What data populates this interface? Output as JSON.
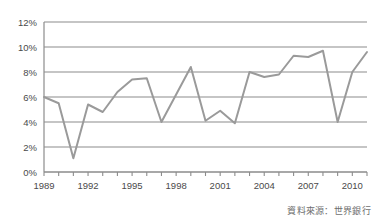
{
  "chart_data": {
    "type": "line",
    "title": "",
    "subtitle": "",
    "xlabel": "",
    "ylabel": "",
    "xlim": [
      1989,
      2011
    ],
    "ylim": [
      0,
      12
    ],
    "ytick_labels": [
      "0%",
      "2%",
      "4%",
      "6%",
      "8%",
      "10%",
      "12%"
    ],
    "ytick_values": [
      0,
      2,
      4,
      6,
      8,
      10,
      12
    ],
    "xtick_labels": [
      "1989",
      "1992",
      "1995",
      "1998",
      "2001",
      "2004",
      "2007",
      "2010"
    ],
    "xtick_values": [
      1989,
      1992,
      1995,
      1998,
      2001,
      2004,
      2007,
      2010
    ],
    "minor_xticks": [
      1989,
      1990,
      1991,
      1992,
      1993,
      1994,
      1995,
      1996,
      1997,
      1998,
      1999,
      2000,
      2001,
      2002,
      2003,
      2004,
      2005,
      2006,
      2007,
      2008,
      2009,
      2010,
      2011
    ],
    "grid": true,
    "grid_axis": "y",
    "legend": false,
    "legend_position": "none",
    "x": [
      1989,
      1990,
      1991,
      1992,
      1993,
      1994,
      1995,
      1996,
      1997,
      1998,
      1999,
      2000,
      2001,
      2002,
      2003,
      2004,
      2005,
      2006,
      2007,
      2008,
      2009,
      2010,
      2011
    ],
    "values": [
      6.0,
      5.5,
      1.1,
      5.4,
      4.8,
      6.4,
      7.4,
      7.5,
      4.0,
      6.2,
      8.4,
      4.1,
      4.9,
      3.9,
      8.0,
      7.6,
      7.8,
      9.3,
      9.2,
      9.7,
      4.0,
      8.0,
      9.6
    ],
    "series": [
      {
        "name": "",
        "color": "#9a9a9a",
        "values": [
          6.0,
          5.5,
          1.1,
          5.4,
          4.8,
          6.4,
          7.4,
          7.5,
          4.0,
          6.2,
          8.4,
          4.1,
          4.9,
          3.9,
          8.0,
          7.6,
          7.8,
          9.3,
          9.2,
          9.7,
          4.0,
          8.0,
          9.6
        ]
      }
    ],
    "annotations": []
  },
  "figure": {
    "source_note": "資料來源：世界銀行",
    "colors": {
      "line": "#9a9a9a",
      "grid": "#8c8c8c",
      "axis": "#8c8c8c",
      "tick_text": "#4a4a4a",
      "source_text": "#6e6e6e",
      "background": "#ffffff"
    }
  }
}
